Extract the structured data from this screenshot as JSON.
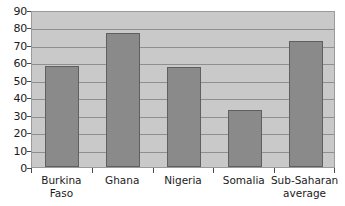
{
  "chart_data": {
    "type": "bar",
    "title": "",
    "subtitle": "",
    "xlabel": "",
    "ylabel": "",
    "categories": [
      "Burkina Faso",
      "Ghana",
      "Nigeria",
      "Somalia",
      "Sub-Saharan average"
    ],
    "category_lines": [
      [
        "Burkina",
        "Faso"
      ],
      [
        "Ghana",
        ""
      ],
      [
        "Nigeria",
        ""
      ],
      [
        "Somalia",
        ""
      ],
      [
        "Sub-Saharan",
        "average"
      ]
    ],
    "values": [
      58,
      77,
      57.5,
      32.5,
      72.5
    ],
    "ylim": [
      0,
      90
    ],
    "ytick_step": 10,
    "ytick_labels": [
      "90",
      "80",
      "70",
      "60",
      "50",
      "40",
      "30",
      "20",
      "10",
      "0"
    ],
    "grid": true,
    "grid_axis": "y",
    "legend": false,
    "legend_position": "none",
    "colors": {
      "bar_fill": "#8a8a8a",
      "bar_border": "#5f5f5f",
      "plot_background": "#c9c9c9",
      "gridline": "#8f8f8f",
      "axis": "#4a4a4a",
      "text": "#1b1b1b",
      "page_background": "#ffffff"
    }
  }
}
